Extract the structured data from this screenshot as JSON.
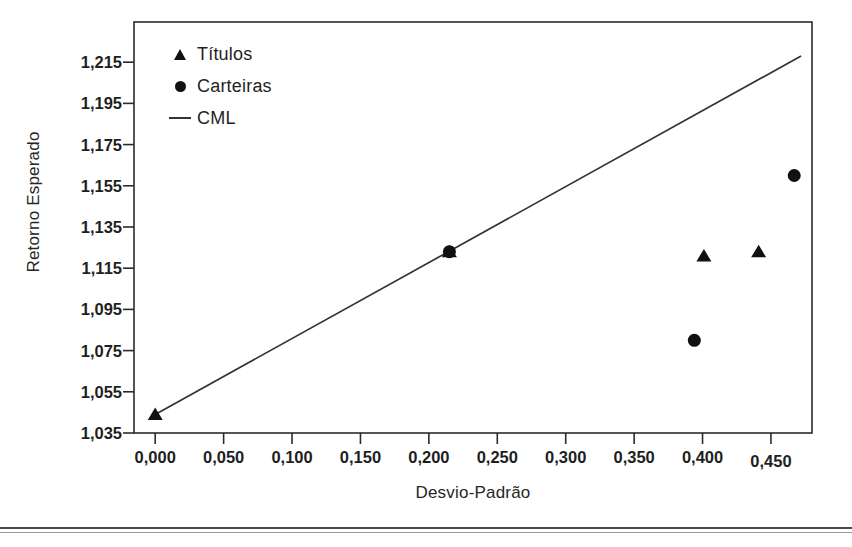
{
  "chart_data": {
    "type": "scatter",
    "title": "",
    "xlabel": "Desvio-Padrão",
    "ylabel": "Retorno Esperado",
    "xlim": [
      -0.0155,
      0.48
    ],
    "ylim": [
      1.035,
      1.2345
    ],
    "grid": false,
    "legend_position": "top-left",
    "xticks": [
      "0,000",
      "0,050",
      "0,100",
      "0,150",
      "0,200",
      "0,250",
      "0,300",
      "0,350",
      "0,400",
      "0,450"
    ],
    "xtick_values": [
      0.0,
      0.05,
      0.1,
      0.15,
      0.2,
      0.25,
      0.3,
      0.35,
      0.4,
      0.45
    ],
    "yticks": [
      "1,035",
      "1,055",
      "1,075",
      "1,095",
      "1,115",
      "1,135",
      "1,155",
      "1,175",
      "1,195",
      "1,215"
    ],
    "ytick_values": [
      1.035,
      1.055,
      1.075,
      1.095,
      1.115,
      1.135,
      1.155,
      1.175,
      1.195,
      1.215
    ],
    "series": [
      {
        "name": "Títulos",
        "marker": "triangle",
        "color": "#111111",
        "points": [
          {
            "x": 0.0,
            "y": 1.044
          },
          {
            "x": 0.215,
            "y": 1.123
          },
          {
            "x": 0.401,
            "y": 1.121
          },
          {
            "x": 0.441,
            "y": 1.123
          }
        ]
      },
      {
        "name": "Carteiras",
        "marker": "circle",
        "color": "#111111",
        "points": [
          {
            "x": 0.215,
            "y": 1.123
          },
          {
            "x": 0.394,
            "y": 1.08
          },
          {
            "x": 0.467,
            "y": 1.16
          }
        ]
      },
      {
        "name": "CML",
        "marker": "line",
        "color": "#333333",
        "points": [
          {
            "x": 0.0,
            "y": 1.044
          },
          {
            "x": 0.472,
            "y": 1.218
          }
        ]
      }
    ]
  },
  "legend": {
    "items": [
      {
        "label": "Títulos",
        "key": "triangle-marker-icon"
      },
      {
        "label": "Carteiras",
        "key": "circle-marker-icon"
      },
      {
        "label": "CML",
        "key": "line-marker-icon"
      }
    ]
  },
  "axes": {
    "x_title": "Desvio-Padrão",
    "y_title": "Retorno Esperado"
  }
}
